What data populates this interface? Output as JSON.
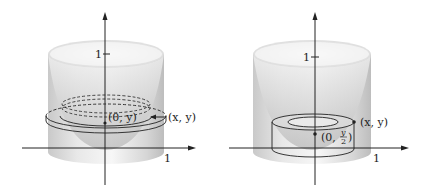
{
  "figures": [
    {
      "id": "left",
      "description": "Paraboloid bowl inside cylinder with horizontal washer slice",
      "labels": {
        "y_tick": "1",
        "x_tick": "1",
        "inner_point": "(0, y)",
        "outer_point": "(x, y)"
      }
    },
    {
      "id": "right",
      "description": "Paraboloid bowl inside cylinder with cylindrical shell",
      "labels": {
        "y_tick": "1",
        "x_tick": "1",
        "center_point_prefix": "(0, ",
        "center_point_num": "y",
        "center_point_den": "2",
        "center_point_suffix": ")",
        "outer_point": "(x, y)"
      }
    }
  ],
  "colors": {
    "surface_light": "#f2f2f2",
    "surface_mid": "#cfcfcf",
    "surface_dark": "#a8a8a8",
    "line": "#222222"
  }
}
